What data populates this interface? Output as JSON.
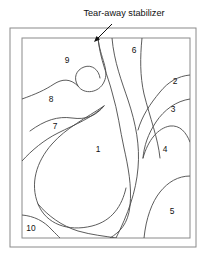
{
  "figure": {
    "title": "Tear-away stabilizer",
    "kind": "quilting-pattern-diagram",
    "colors": {
      "frame_stroke": "#8a8a8a",
      "pattern_stroke": "#4a4a4a",
      "text": "#111111",
      "background": "#ffffff"
    },
    "annotation": {
      "label": "Tear-away stabilizer",
      "label_x": 124,
      "label_y": 16,
      "arrow_from_x": 112,
      "arrow_from_y": 24,
      "arrow_to_x": 94,
      "arrow_to_y": 42
    },
    "frames": [
      {
        "name": "outer-frame",
        "x": 10,
        "y": 28,
        "width": 186,
        "height": 219
      },
      {
        "name": "inner-frame",
        "x": 22,
        "y": 38,
        "width": 168,
        "height": 200
      }
    ],
    "regions": [
      {
        "id": "1",
        "label": "1",
        "x": 98,
        "y": 152
      },
      {
        "id": "2",
        "label": "2",
        "x": 175,
        "y": 84
      },
      {
        "id": "3",
        "label": "3",
        "x": 173,
        "y": 112
      },
      {
        "id": "4",
        "label": "4",
        "x": 165,
        "y": 152
      },
      {
        "id": "5",
        "label": "5",
        "x": 172,
        "y": 214
      },
      {
        "id": "6",
        "label": "6",
        "x": 134,
        "y": 53
      },
      {
        "id": "7",
        "label": "7",
        "x": 55,
        "y": 129
      },
      {
        "id": "8",
        "label": "8",
        "x": 51,
        "y": 102
      },
      {
        "id": "9",
        "label": "9",
        "x": 67,
        "y": 63
      },
      {
        "id": "10",
        "label": "10",
        "x": 31,
        "y": 231
      }
    ],
    "paths": [
      {
        "name": "region-9-hook-curve",
        "d": "M 98 38 C 100 58 110 70 104 82 C 99 93 84 95 78 86 C 73 78 76 70 84 67 C 92 64 99 70 100 78"
      },
      {
        "name": "region-8-upper-boundary",
        "d": "M 22 99 C 36 94 45 90 54 84 C 62 79 70 78 78 86"
      },
      {
        "name": "region-8-lower-boundary",
        "d": "M 30 131 C 45 120 58 116 72 118 C 86 120 96 116 104 106"
      },
      {
        "name": "region-7-boundary",
        "d": "M 22 161 C 32 150 44 140 58 133 C 76 124 92 118 104 106"
      },
      {
        "name": "spine-main-s-curve",
        "d": "M 98 38 C 100 60 108 76 112 92 C 118 112 120 130 124 148 C 128 166 132 186 130 206 C 128 224 120 232 110 238"
      },
      {
        "name": "spine-secondary-curve",
        "d": "M 112 38 C 114 62 122 82 128 100 C 136 124 140 146 138 168 C 136 192 128 214 116 238"
      },
      {
        "name": "region-6-right-edge",
        "d": "M 142 38 C 140 58 140 76 144 94 C 150 118 158 138 160 158"
      },
      {
        "name": "region-1-left-lobe",
        "d": "M 104 106 C 86 118 66 128 52 144 C 36 162 30 184 38 204 C 46 224 68 232 92 226 C 112 221 122 206 126 188"
      },
      {
        "name": "region-1-lower-tail",
        "d": "M 38 204 C 48 216 62 226 78 231 C 92 235 104 236 116 238"
      },
      {
        "name": "region-10-corner-arc",
        "d": "M 22 215 C 34 216 44 221 52 230 C 56 234 58 236 60 238"
      },
      {
        "name": "region-2-boundary",
        "d": "M 190 75 C 178 76 168 82 160 92 C 150 104 142 116 138 130"
      },
      {
        "name": "region-3-boundary",
        "d": "M 190 99 C 176 101 164 110 156 122 C 148 134 144 146 143 158"
      },
      {
        "name": "region-4-boundary",
        "d": "M 143 158 C 148 140 158 128 170 126 C 180 125 186 132 190 142"
      },
      {
        "name": "region-5-boundary",
        "d": "M 190 176 C 178 176 168 182 160 192 C 152 202 146 218 144 238"
      }
    ]
  }
}
